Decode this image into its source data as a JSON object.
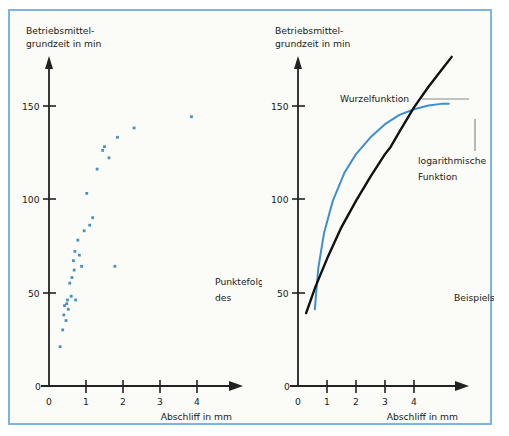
{
  "figure": {
    "title_visible": false,
    "frame_border_color": "#7ab6e0",
    "background_color": "#fbfbf8"
  },
  "colors": {
    "accent_blue": "#3f8fd0",
    "point_blue": "#4a90c4",
    "curve_black": "#111111",
    "axis_black": "#222222",
    "leader_gray": "#8a8a8a",
    "frame_blue": "#7ab6e0"
  },
  "annotations": {
    "punktefolge_line1": "Punktefolge",
    "punktefolge_line2": "des",
    "beispiels": "Beispiels",
    "wurzelfunktion": "Wurzelfunktion",
    "log_line1": "logarithmische",
    "log_line2": "Funktion"
  },
  "chart_data": [
    {
      "id": "left",
      "type": "scatter",
      "title": "",
      "ylabel_line1": "Betriebsmittel-",
      "ylabel_line2": "grundzeit in min",
      "xlabel": "Abschliff in mm",
      "xlim": [
        0,
        4.8
      ],
      "ylim": [
        0,
        185
      ],
      "xticks": [
        0,
        1,
        2,
        3,
        4
      ],
      "xtick_labels": [
        "0",
        "1",
        "2",
        "3",
        "4"
      ],
      "yticks": [
        0,
        50,
        100,
        150
      ],
      "ytick_labels": [
        "0",
        "50",
        "100",
        "150"
      ],
      "grid": false,
      "legend": "none",
      "series": [
        {
          "name": "Punktefolge des Beispiels",
          "marker": "square",
          "color": "#4a90c4",
          "points": [
            [
              0.3,
              21
            ],
            [
              0.37,
              30
            ],
            [
              0.4,
              38
            ],
            [
              0.42,
              43
            ],
            [
              0.46,
              35
            ],
            [
              0.48,
              44
            ],
            [
              0.5,
              46
            ],
            [
              0.52,
              41
            ],
            [
              0.56,
              55
            ],
            [
              0.6,
              48
            ],
            [
              0.62,
              58
            ],
            [
              0.66,
              67
            ],
            [
              0.68,
              62
            ],
            [
              0.7,
              72
            ],
            [
              0.72,
              46
            ],
            [
              0.78,
              78
            ],
            [
              0.82,
              70
            ],
            [
              0.88,
              64
            ],
            [
              0.95,
              83
            ],
            [
              1.02,
              103
            ],
            [
              1.1,
              86
            ],
            [
              1.18,
              90
            ],
            [
              1.3,
              116
            ],
            [
              1.45,
              126
            ],
            [
              1.5,
              128
            ],
            [
              1.62,
              122
            ],
            [
              1.78,
              64
            ],
            [
              1.85,
              133
            ],
            [
              2.3,
              138
            ],
            [
              3.85,
              144
            ]
          ]
        }
      ]
    },
    {
      "id": "right",
      "type": "line",
      "title": "",
      "ylabel_line1": "Betriebsmittel-",
      "ylabel_line2": "grundzeit in min",
      "xlabel": "Abschliff in mm",
      "xlim": [
        0,
        5.6
      ],
      "ylim": [
        0,
        185
      ],
      "xticks": [
        0,
        1,
        2,
        3,
        4
      ],
      "xtick_labels": [
        "0",
        "1",
        "2",
        "3",
        "4"
      ],
      "yticks": [
        0,
        50,
        100,
        150
      ],
      "ytick_labels": [
        "0",
        "50",
        "100",
        "150"
      ],
      "grid": false,
      "legend": "annotated-inline",
      "series": [
        {
          "name": "Wurzelfunktion",
          "color": "#111111",
          "width": 2.4,
          "x": [
            0.28,
            0.6,
            1.0,
            1.5,
            2.0,
            2.5,
            3.0,
            3.2,
            3.5,
            4.0,
            4.5,
            5.0,
            5.3
          ],
          "y": [
            39,
            53,
            68,
            85,
            99,
            112,
            124,
            128,
            136,
            149,
            160,
            170,
            176
          ]
        },
        {
          "name": "logarithmische Funktion",
          "color": "#3f8fd0",
          "width": 2.0,
          "x": [
            0.58,
            0.7,
            0.9,
            1.2,
            1.6,
            2.0,
            2.5,
            3.0,
            3.2,
            3.5,
            4.0,
            4.5,
            5.0,
            5.2
          ],
          "y": [
            41,
            63,
            82,
            99,
            114,
            124,
            133,
            140,
            142,
            145,
            148,
            150,
            151,
            151
          ]
        }
      ]
    }
  ]
}
